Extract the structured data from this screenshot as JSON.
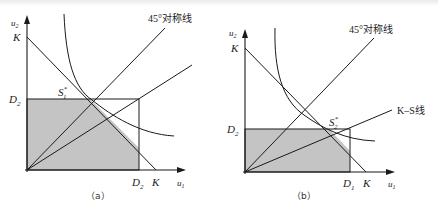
{
  "figure": {
    "panels": [
      {
        "id": "a",
        "caption": "（a）",
        "y_axis_label": "u",
        "y_axis_sub": "2",
        "x_axis_label": "u",
        "x_axis_sub": "1",
        "y_intercept_label": "K",
        "x_intercept_label": "K",
        "horizontal_bound_label": "D",
        "horizontal_bound_sub": "2",
        "vertical_bound_label": "D",
        "vertical_bound_sub": "2",
        "solution_label": "S",
        "solution_sub": "1",
        "solution_sup": "*",
        "line_45_label": "45°对称线"
      },
      {
        "id": "b",
        "caption": "（b）",
        "y_axis_label": "u",
        "y_axis_sub": "2",
        "x_axis_label": "u",
        "x_axis_sub": "1",
        "y_intercept_label": "K",
        "x_intercept_label": "K",
        "horizontal_bound_label": "D",
        "horizontal_bound_sub": "2",
        "vertical_bound_label": "D",
        "vertical_bound_sub": "1",
        "solution_label": "S",
        "solution_sub": "2",
        "solution_sup": "*",
        "line_45_label": "45°对称线",
        "ks_line_label": "K–S线"
      }
    ],
    "colors": {
      "shade": "#c4c4c4",
      "stroke": "#1a1a1a"
    }
  }
}
